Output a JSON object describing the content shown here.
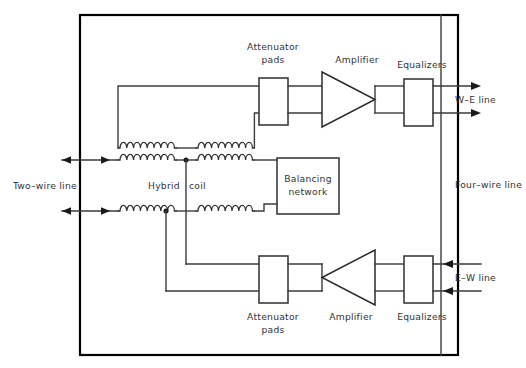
{
  "diagram": {
    "title_labels": {
      "attenuator_pads_top": "Attenuator\npads",
      "attenuator_pads_top_line1": "Attenuator",
      "attenuator_pads_top_line2": "pads",
      "amplifier_top": "Amplifier",
      "equalizers_top": "Equalizers",
      "we_line": "W–E line",
      "four_wire_line": "Four–wire line",
      "two_wire_line": "Two–wire line",
      "hybrid_coil": "Hybrid  coil",
      "hybrid_coil_word1": "Hybrid",
      "hybrid_coil_word2": "coil",
      "balancing_network_line1": "Balancing",
      "balancing_network_line2": "network",
      "attenuator_pads_bottom_line1": "Attenuator",
      "attenuator_pads_bottom_line2": "pads",
      "amplifier_bottom": "Amplifier",
      "equalizers_bottom": "Equalizers",
      "ew_line": "E–W line"
    },
    "blocks": [
      {
        "id": "attenuator-pads-top",
        "label": "Attenuator pads"
      },
      {
        "id": "amplifier-top",
        "label": "Amplifier"
      },
      {
        "id": "equalizers-top",
        "label": "Equalizers"
      },
      {
        "id": "balancing-network",
        "label": "Balancing network"
      },
      {
        "id": "attenuator-pads-bottom",
        "label": "Attenuator pads"
      },
      {
        "id": "amplifier-bottom",
        "label": "Amplifier"
      },
      {
        "id": "equalizers-bottom",
        "label": "Equalizers"
      }
    ],
    "coil_count": 6,
    "colors": {
      "frame": "#000000",
      "wire": "#3b3b3b",
      "text": "#333333",
      "background": "#ffffff"
    }
  }
}
